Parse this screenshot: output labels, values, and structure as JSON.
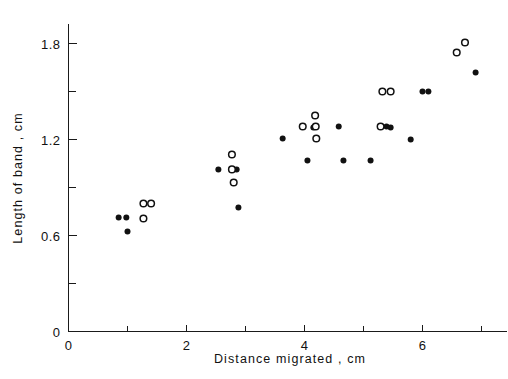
{
  "chart_data": {
    "type": "scatter",
    "title": "",
    "xlabel": "Distance  migrated , cm",
    "ylabel": "Length  of  band , cm",
    "xlim": [
      0,
      7.45
    ],
    "ylim": [
      0,
      1.95
    ],
    "grid": false,
    "legend_position": "none",
    "x_ticks_major": [
      0,
      2,
      4,
      6
    ],
    "x_tick_labels": [
      "0",
      "2",
      "4",
      "6"
    ],
    "x_ticks_minor": [
      1,
      3,
      5,
      7
    ],
    "y_ticks_major": [
      0,
      0.6,
      1.2,
      1.8
    ],
    "y_tick_labels": [
      "0",
      "0.6",
      "1.2",
      "1.8"
    ],
    "y_ticks_minor": [
      0.3,
      0.9,
      1.5
    ],
    "series": [
      {
        "name": "filled",
        "marker": "filled-circle",
        "color": "#111111",
        "points": [
          [
            0.85,
            0.713
          ],
          [
            0.98,
            0.713
          ],
          [
            1.0,
            0.625
          ],
          [
            2.54,
            1.013
          ],
          [
            2.85,
            1.013
          ],
          [
            2.88,
            0.775
          ],
          [
            3.63,
            1.206
          ],
          [
            4.05,
            1.069
          ],
          [
            4.15,
            1.275
          ],
          [
            4.58,
            1.281
          ],
          [
            4.66,
            1.069
          ],
          [
            5.12,
            1.069
          ],
          [
            5.39,
            1.281
          ],
          [
            5.46,
            1.275
          ],
          [
            5.8,
            1.2
          ],
          [
            6.0,
            1.5
          ],
          [
            6.1,
            1.5
          ],
          [
            6.9,
            1.619
          ]
        ]
      },
      {
        "name": "open",
        "marker": "open-circle",
        "color": "#111111",
        "points": [
          [
            1.27,
            0.8
          ],
          [
            1.4,
            0.8
          ],
          [
            1.27,
            0.706
          ],
          [
            2.77,
            1.106
          ],
          [
            2.77,
            1.013
          ],
          [
            2.8,
            0.931
          ],
          [
            3.97,
            1.281
          ],
          [
            4.18,
            1.35
          ],
          [
            4.19,
            1.281
          ],
          [
            4.2,
            1.206
          ],
          [
            5.29,
            1.281
          ],
          [
            5.32,
            1.5
          ],
          [
            5.46,
            1.5
          ],
          [
            6.58,
            1.744
          ],
          [
            6.72,
            1.806
          ]
        ]
      }
    ]
  },
  "axes": {
    "x_title": "Distance  migrated , cm",
    "y_title": "Length  of  band , cm"
  }
}
